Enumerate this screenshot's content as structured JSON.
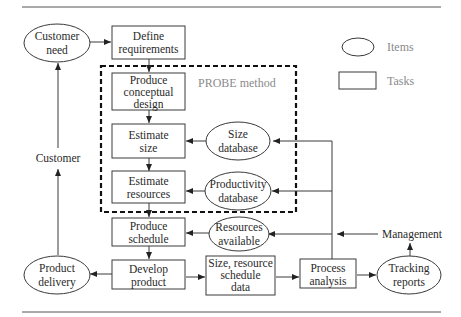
{
  "diagram": {
    "legend": {
      "items_label": "Items",
      "tasks_label": "Tasks"
    },
    "probe_label": "PROBE method",
    "items": {
      "customer_need": [
        "Customer",
        "need"
      ],
      "size_database": [
        "Size",
        "database"
      ],
      "productivity_database": [
        "Productivity",
        "database"
      ],
      "resources_available": [
        "Resources",
        "available"
      ],
      "product_delivery": [
        "Product",
        "delivery"
      ],
      "tracking_reports": [
        "Tracking",
        "reports"
      ]
    },
    "tasks": {
      "define_requirements": [
        "Define",
        "requirements"
      ],
      "produce_conceptual_design": [
        "Produce",
        "conceptual",
        "design"
      ],
      "estimate_size": [
        "Estimate",
        "size"
      ],
      "estimate_resources": [
        "Estimate",
        "resources"
      ],
      "produce_schedule": [
        "Produce",
        "schedule"
      ],
      "develop_product": [
        "Develop",
        "product"
      ],
      "size_resource_schedule_data": [
        "Size, resource",
        "schedule",
        "data"
      ],
      "process_analysis": [
        "Process",
        "analysis"
      ]
    },
    "labels": {
      "customer": "Customer",
      "management": "Management"
    }
  }
}
